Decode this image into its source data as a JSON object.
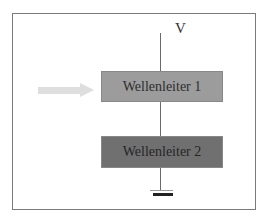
{
  "diagram": {
    "supply_label": "V",
    "blocks": [
      {
        "label": "Wellenleiter 1",
        "color": "#9c9c9c"
      },
      {
        "label": "Wellenleiter 2",
        "color": "#707070"
      }
    ],
    "input_arrow": {
      "icon": "input-arrow-icon",
      "color": "#dcdcdc"
    },
    "ground": {
      "icon": "ground-icon"
    }
  }
}
